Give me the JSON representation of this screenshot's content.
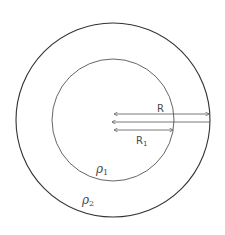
{
  "diagram": {
    "type": "concentric-circles",
    "outer_circle": {
      "cx": 113,
      "cy": 120,
      "r": 97,
      "stroke": "#333333",
      "label": "ρ2"
    },
    "inner_circle": {
      "cx": 113,
      "cy": 120,
      "r": 61,
      "stroke": "#555555",
      "label": "ρ1"
    },
    "arrows": {
      "outer_radius": {
        "label": "R",
        "y": 114
      },
      "inner_radius": {
        "label": "R",
        "subscript": "1",
        "y": 130
      }
    },
    "labels": {
      "R": "R",
      "R1_main": "R",
      "R1_sub": "1",
      "rho1_main": "ρ",
      "rho1_sub": "1",
      "rho2_main": "ρ",
      "rho2_sub": "2"
    },
    "colors": {
      "line": "#333333",
      "arrow": "#555555",
      "text": "#4a4a4a",
      "background": "#ffffff"
    }
  }
}
